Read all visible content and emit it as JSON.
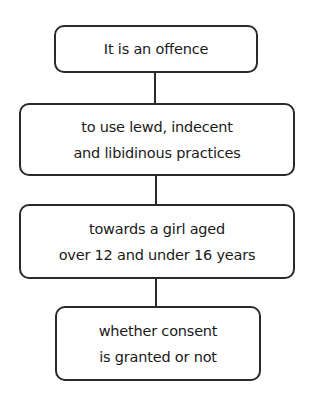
{
  "diagram": {
    "type": "flowchart",
    "direction": "top-to-bottom",
    "nodes": [
      {
        "id": "n1",
        "lines": [
          "It is an offence"
        ]
      },
      {
        "id": "n2",
        "lines": [
          "to use lewd, indecent",
          "and libidinous practices"
        ]
      },
      {
        "id": "n3",
        "lines": [
          "towards a girl aged",
          "over 12 and under 16 years"
        ]
      },
      {
        "id": "n4",
        "lines": [
          "whether consent",
          "is granted or not"
        ]
      }
    ],
    "edges": [
      {
        "from": "n1",
        "to": "n2"
      },
      {
        "from": "n2",
        "to": "n3"
      },
      {
        "from": "n3",
        "to": "n4"
      }
    ],
    "colors": {
      "stroke": "#2a2a2a",
      "text": "#1a1a1a",
      "background": "#ffffff"
    }
  }
}
